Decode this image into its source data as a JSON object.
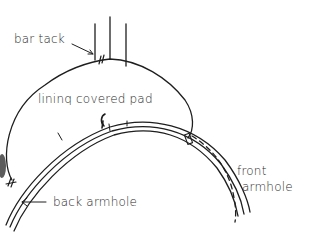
{
  "diagram": {
    "type": "sewing-illustration",
    "labels": {
      "bar_tack": "bar tack",
      "lining_pad": "lininq covered pad",
      "back_armhole": "back  armhole",
      "front_line1": "front",
      "front_line2": "armhole"
    },
    "colors": {
      "ink": "#1e1e1e",
      "background": "#ffffff"
    }
  }
}
